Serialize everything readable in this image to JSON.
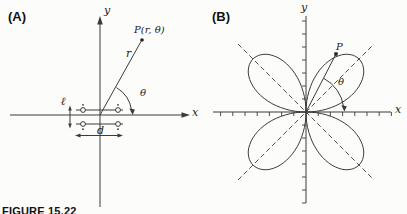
{
  "figure": {
    "caption": "FIGURE 15.22",
    "panel_a": {
      "label": "(A)",
      "y_axis_label": "y",
      "x_axis_label": "x",
      "point_label": "P(r, θ)",
      "radius_label": "r",
      "angle_label": "θ",
      "vertical_spacing_label": "ℓ",
      "horizontal_spacing_label": "d"
    },
    "panel_b": {
      "label": "(B)",
      "y_axis_label": "y",
      "x_axis_label": "x",
      "point_label": "P",
      "angle_label": "θ",
      "rose": {
        "type": "polar-rose",
        "num_petals": 4,
        "petal_length": 75,
        "petal_angles_deg": [
          45,
          135,
          225,
          315
        ]
      }
    }
  }
}
